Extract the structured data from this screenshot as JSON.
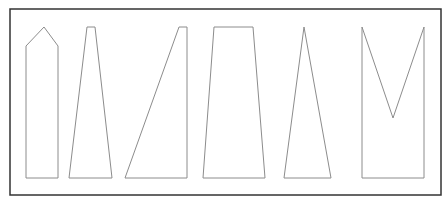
{
  "diagram": {
    "frame": {
      "x": 10,
      "y": 9,
      "width": 431,
      "height": 186,
      "stroke": "#333333"
    },
    "shape_stroke": "#8c8c8c",
    "shapes": [
      {
        "name": "pentagon-arrow",
        "points": "26,178 26,46 44,27 58,46 58,178"
      },
      {
        "name": "narrow-trapezoid",
        "points": "69,178 87,27 95,27 112,178"
      },
      {
        "name": "right-trapezoid-slanted",
        "points": "125,178 179,27 187,27 187,178"
      },
      {
        "name": "wide-trapezoid",
        "points": "203,178 214,27 253,27 265,178"
      },
      {
        "name": "tall-triangle",
        "points": "284,178 304,27 331,178"
      },
      {
        "name": "notched-rectangle",
        "points": "362,178 362,27 393,118 424,27 424,178"
      }
    ]
  }
}
